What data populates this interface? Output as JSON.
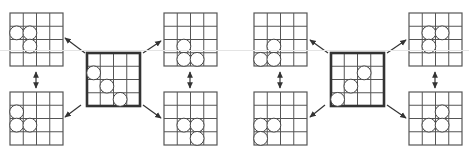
{
  "diagram": {
    "colors": {
      "grid_line": "#555555",
      "bold_border": "#333333",
      "stone_fill": "#ffffff",
      "stone_stroke": "#444444",
      "arrow": "#333333",
      "background": "#ffffff"
    },
    "grid_size": 4,
    "cell_px": 13.25,
    "panels": [
      {
        "id": "left-panel",
        "center": {
          "x": 87,
          "y": 53,
          "bold": true,
          "stones": [
            [
              0,
              1
            ],
            [
              1,
              2
            ],
            [
              2,
              3
            ]
          ]
        },
        "boards": [
          {
            "id": "top-left",
            "x": 10,
            "y": 13,
            "stones": [
              [
                0,
                1
              ],
              [
                1,
                1
              ],
              [
                1,
                2
              ]
            ]
          },
          {
            "id": "bottom-left",
            "x": 10,
            "y": 92,
            "stones": [
              [
                0,
                1
              ],
              [
                0,
                2
              ],
              [
                1,
                2
              ]
            ]
          },
          {
            "id": "top-right",
            "x": 164,
            "y": 13,
            "stones": [
              [
                1,
                2
              ],
              [
                1,
                3
              ],
              [
                2,
                3
              ]
            ]
          },
          {
            "id": "bottom-right",
            "x": 164,
            "y": 92,
            "stones": [
              [
                1,
                2
              ],
              [
                2,
                2
              ],
              [
                2,
                3
              ]
            ]
          }
        ],
        "arrows": [
          {
            "from": [
              85,
              53
            ],
            "to": [
              65,
              38
            ],
            "type": "single"
          },
          {
            "from": [
              81,
              105
            ],
            "to": [
              65,
              117
            ],
            "type": "single"
          },
          {
            "from": [
              143,
              53
            ],
            "to": [
              161,
              41
            ],
            "type": "single"
          },
          {
            "from": [
              143,
              105
            ],
            "to": [
              161,
              118
            ],
            "type": "single"
          },
          {
            "from": [
              36,
              72
            ],
            "to": [
              36,
              88
            ],
            "type": "double"
          },
          {
            "from": [
              190,
              72
            ],
            "to": [
              190,
              88
            ],
            "type": "double"
          }
        ]
      },
      {
        "id": "right-panel",
        "center": {
          "x": 331,
          "y": 53,
          "bold": true,
          "stones": [
            [
              2,
              1
            ],
            [
              1,
              2
            ],
            [
              0,
              3
            ]
          ]
        },
        "boards": [
          {
            "id": "top-left",
            "x": 254,
            "y": 13,
            "stones": [
              [
                1,
                2
              ],
              [
                0,
                3
              ],
              [
                1,
                3
              ]
            ]
          },
          {
            "id": "bottom-left",
            "x": 254,
            "y": 92,
            "stones": [
              [
                0,
                2
              ],
              [
                1,
                2
              ],
              [
                0,
                3
              ]
            ]
          },
          {
            "id": "top-right",
            "x": 409,
            "y": 13,
            "stones": [
              [
                1,
                1
              ],
              [
                2,
                1
              ],
              [
                1,
                2
              ]
            ]
          },
          {
            "id": "bottom-right",
            "x": 409,
            "y": 92,
            "stones": [
              [
                2,
                1
              ],
              [
                1,
                2
              ],
              [
                2,
                2
              ]
            ]
          }
        ],
        "arrows": [
          {
            "from": [
              328,
              53
            ],
            "to": [
              310,
              40
            ],
            "type": "single"
          },
          {
            "from": [
              325,
              105
            ],
            "to": [
              310,
              117
            ],
            "type": "single"
          },
          {
            "from": [
              387,
              53
            ],
            "to": [
              406,
              40
            ],
            "type": "single"
          },
          {
            "from": [
              387,
              105
            ],
            "to": [
              406,
              118
            ],
            "type": "single"
          },
          {
            "from": [
              280,
              72
            ],
            "to": [
              280,
              88
            ],
            "type": "double"
          },
          {
            "from": [
              435,
              72
            ],
            "to": [
              435,
              88
            ],
            "type": "double"
          }
        ]
      }
    ]
  }
}
